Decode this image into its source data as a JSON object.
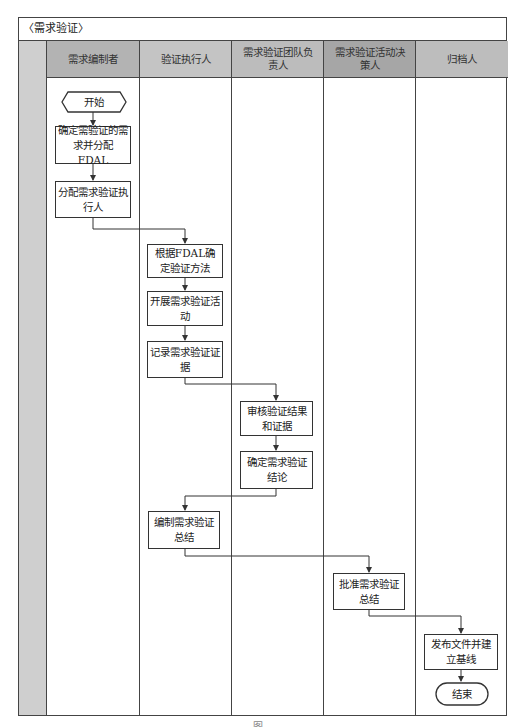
{
  "diagram": {
    "title": "〈需求验证〉",
    "lanes": [
      {
        "label": "需求编制者",
        "bg": "#b3b3b3"
      },
      {
        "label": "验证执行人",
        "bg": "#c4c4c4"
      },
      {
        "label": "需求验证团队负责人",
        "bg": "#bcbcbc"
      },
      {
        "label": "需求验证活动决策人",
        "bg": "#a6a6a6"
      },
      {
        "label": "归档人",
        "bg": "#bdbdbd"
      }
    ],
    "nodes": {
      "start": "开始",
      "n1": "确定需验证的需求并分配FDAL",
      "n2": "分配需求验证执行人",
      "n3": "根据FDAL确定验证方法",
      "n4": "开展需求验证活动",
      "n5": "记录需求验证证据",
      "n6": "审核验证结果和证据",
      "n7": "确定需求验证结论",
      "n8": "编制需求验证总结",
      "n9": "批准需求验证总结",
      "n10": "发布文件并建立基线",
      "end": "结束"
    },
    "caption": "图"
  }
}
